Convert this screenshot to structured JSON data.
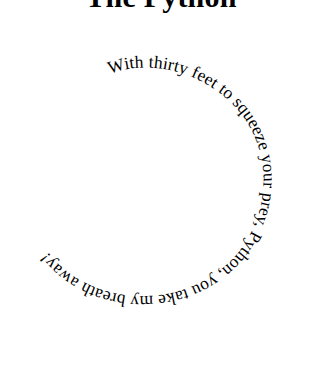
{
  "page": {
    "background_color": "#ffffff",
    "text_color": "#000000",
    "width": 322,
    "height": 376
  },
  "title": {
    "text": "The Python",
    "clipped_at_top": true
  },
  "poem": {
    "full_text": "With thirty feet to squeeze your prey, Python, you take my breath away!",
    "layout": "spiral",
    "direction": "clockwise",
    "start_position": "top-center",
    "segments": [
      "With thirty feet to squeeze",
      "your prey, Python,",
      "you take my breath away!"
    ]
  }
}
